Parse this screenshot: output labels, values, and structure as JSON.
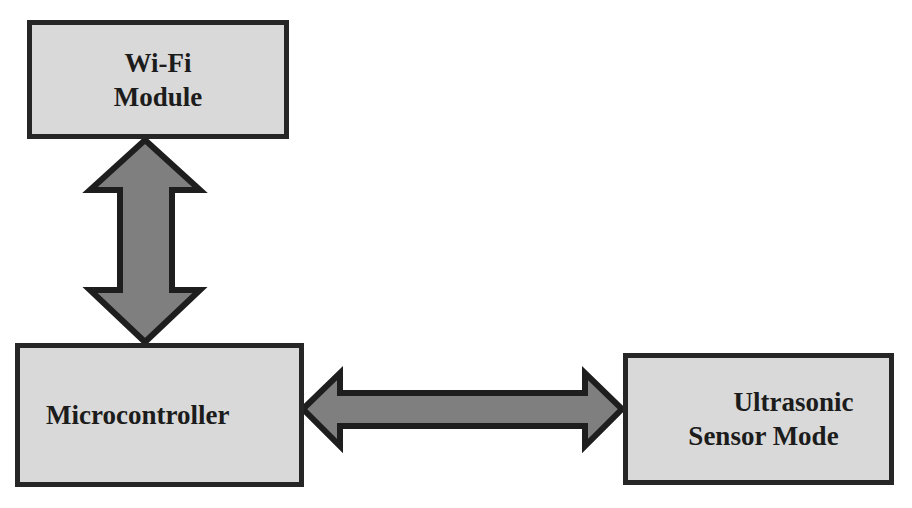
{
  "diagram": {
    "title": "",
    "colors": {
      "box_fill": "#d9d9d9",
      "box_border": "#262626",
      "arrow_fill": "#7f7f7f",
      "arrow_border": "#1e1e1e",
      "background": "#ffffff"
    },
    "nodes": [
      {
        "id": "wifi",
        "label_lines": [
          "Wi-Fi",
          "Module"
        ]
      },
      {
        "id": "mcu",
        "label_lines": [
          "Microcontroller"
        ]
      },
      {
        "id": "us",
        "label_lines": [
          "Ultrasonic",
          "Sensor Mode"
        ]
      }
    ],
    "edges": [
      {
        "from": "wifi",
        "to": "mcu",
        "type": "bidirectional"
      },
      {
        "from": "mcu",
        "to": "us",
        "type": "bidirectional"
      }
    ]
  }
}
